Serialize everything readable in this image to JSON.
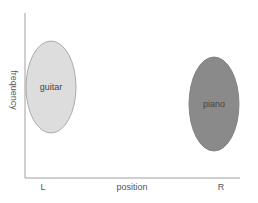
{
  "diagram": {
    "x_axis": {
      "label": "position",
      "left_label": "L",
      "right_label": "R"
    },
    "y_axis": {
      "label": "frequency"
    },
    "regions": [
      {
        "label": "guitar",
        "fill": "#dddddd",
        "stroke": "#999999",
        "cx": 51,
        "cy": 87,
        "rx": 25,
        "ry": 46
      },
      {
        "label": "piano",
        "fill": "#8a8a8a",
        "stroke": "#777777",
        "cx": 214,
        "cy": 104,
        "rx": 25,
        "ry": 47
      }
    ],
    "colors": {
      "axis": "#999999",
      "text": "#555555"
    }
  }
}
